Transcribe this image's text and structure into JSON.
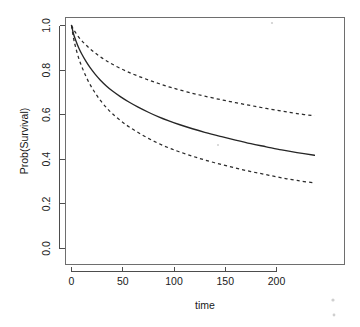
{
  "chart_data": {
    "type": "line",
    "title": "",
    "subtitle": "",
    "xlabel": "time",
    "ylabel": "Prob(Survival)",
    "xlim": [
      -8,
      245
    ],
    "ylim": [
      0.0,
      1.0
    ],
    "grid": false,
    "legend": null,
    "x_ticks": [
      0,
      50,
      100,
      150,
      200
    ],
    "x_tick_labels": [
      "0",
      "50",
      "100",
      "150",
      "200"
    ],
    "y_ticks": [
      0.0,
      0.2,
      0.4,
      0.6,
      0.8,
      1.0
    ],
    "y_tick_labels": [
      "0.0",
      "0.2",
      "0.4",
      "0.6",
      "0.8",
      "1.0"
    ],
    "series": [
      {
        "name": "Survival estimate",
        "style": "solid",
        "x": [
          0,
          2,
          4,
          7,
          10,
          14,
          18,
          23,
          28,
          34,
          40,
          48,
          56,
          65,
          75,
          85,
          95,
          105,
          118,
          130,
          145,
          160,
          175,
          190,
          205,
          220,
          237
        ],
        "values": [
          1.0,
          0.962,
          0.935,
          0.9,
          0.872,
          0.84,
          0.812,
          0.782,
          0.756,
          0.729,
          0.706,
          0.68,
          0.657,
          0.634,
          0.611,
          0.59,
          0.572,
          0.556,
          0.537,
          0.521,
          0.503,
          0.486,
          0.47,
          0.456,
          0.442,
          0.43,
          0.418
        ]
      },
      {
        "name": "Upper 95% confidence limit",
        "style": "dashed",
        "x": [
          0,
          2,
          4,
          7,
          10,
          14,
          18,
          23,
          28,
          34,
          40,
          48,
          56,
          65,
          75,
          85,
          95,
          105,
          118,
          130,
          145,
          160,
          175,
          190,
          205,
          220,
          237
        ],
        "values": [
          1.0,
          0.982,
          0.968,
          0.948,
          0.932,
          0.913,
          0.896,
          0.877,
          0.86,
          0.842,
          0.826,
          0.807,
          0.79,
          0.773,
          0.756,
          0.74,
          0.725,
          0.712,
          0.696,
          0.683,
          0.668,
          0.654,
          0.641,
          0.628,
          0.616,
          0.605,
          0.595
        ]
      },
      {
        "name": "Lower 95% confidence limit",
        "style": "dashed",
        "x": [
          0,
          2,
          4,
          7,
          10,
          14,
          18,
          23,
          28,
          34,
          40,
          48,
          56,
          65,
          75,
          85,
          95,
          105,
          118,
          130,
          145,
          160,
          175,
          190,
          205,
          220,
          237
        ],
        "values": [
          1.0,
          0.943,
          0.903,
          0.854,
          0.816,
          0.773,
          0.736,
          0.698,
          0.665,
          0.632,
          0.604,
          0.573,
          0.546,
          0.52,
          0.494,
          0.471,
          0.451,
          0.434,
          0.414,
          0.397,
          0.378,
          0.361,
          0.345,
          0.331,
          0.317,
          0.305,
          0.294
        ]
      }
    ]
  },
  "axes": {
    "x_label": "time",
    "y_label": "Prob(Survival)"
  }
}
